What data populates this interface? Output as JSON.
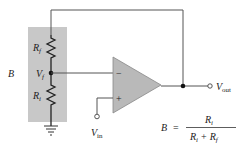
{
  "diagram": {
    "type": "non-inverting op-amp feedback circuit",
    "colors": {
      "wire": "#555555",
      "shade": "#c8c8c8",
      "opamp_fill": "#b9b9b9",
      "text": "#222222"
    },
    "labels": {
      "block_label": "B",
      "rf_main": "R",
      "rf_sub": "f",
      "ri_main": "R",
      "ri_sub": "i",
      "vf_main": "V",
      "vf_sub": "f",
      "vin_main": "V",
      "vin_sub": "in",
      "vout_main": "V",
      "vout_sub": "out",
      "minus": "−",
      "plus": "+"
    },
    "formula": {
      "lhs": "B",
      "equals": "=",
      "numerator_main": "R",
      "numerator_sub": "i",
      "den_a_main": "R",
      "den_a_sub": "i",
      "den_plus": "+",
      "den_b_main": "R",
      "den_b_sub": "f"
    }
  }
}
